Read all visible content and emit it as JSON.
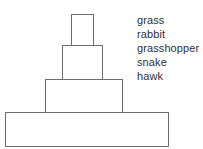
{
  "diagram": {
    "type": "ecological-pyramid",
    "title": "",
    "tiers": [
      {
        "id": "tier-1",
        "level": 1,
        "position": "top",
        "width_px": 23,
        "label": ""
      },
      {
        "id": "tier-2",
        "level": 2,
        "position": "upper-middle",
        "width_px": 41,
        "label": ""
      },
      {
        "id": "tier-3",
        "level": 3,
        "position": "lower-middle",
        "width_px": 78,
        "label": ""
      },
      {
        "id": "tier-4",
        "level": 4,
        "position": "base",
        "width_px": 164,
        "label": ""
      }
    ],
    "outline_color": "#6d6d6d",
    "fill_color": "#ffffff"
  },
  "legend": {
    "items": [
      {
        "label": "grass"
      },
      {
        "label": "rabbit"
      },
      {
        "label": "grasshopper"
      },
      {
        "label": "snake"
      },
      {
        "label": "hawk"
      }
    ]
  },
  "clipped_header": {
    "left_fragment": "",
    "right_fragment": ""
  }
}
